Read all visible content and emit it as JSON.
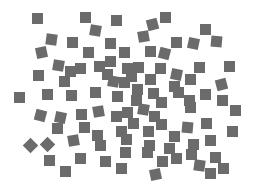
{
  "canvas": {
    "width": 254,
    "height": 190,
    "background": "#ffffff"
  },
  "shape_style": {
    "color": "#6b6b6b",
    "size": 11
  },
  "squares": [
    {
      "x": 37,
      "y": 18,
      "r": 0
    },
    {
      "x": 85,
      "y": 17,
      "r": 0
    },
    {
      "x": 116,
      "y": 20,
      "r": 0
    },
    {
      "x": 165,
      "y": 17,
      "r": 0
    },
    {
      "x": 152,
      "y": 24,
      "r": -15
    },
    {
      "x": 95,
      "y": 30,
      "r": 10
    },
    {
      "x": 205,
      "y": 29,
      "r": 0
    },
    {
      "x": 51,
      "y": 39,
      "r": 8
    },
    {
      "x": 72,
      "y": 42,
      "r": 0
    },
    {
      "x": 110,
      "y": 43,
      "r": 0
    },
    {
      "x": 143,
      "y": 36,
      "r": -10
    },
    {
      "x": 176,
      "y": 42,
      "r": 0
    },
    {
      "x": 193,
      "y": 43,
      "r": 12
    },
    {
      "x": 216,
      "y": 41,
      "r": 5
    },
    {
      "x": 150,
      "y": 51,
      "r": 0
    },
    {
      "x": 41,
      "y": 52,
      "r": -12
    },
    {
      "x": 88,
      "y": 52,
      "r": 0
    },
    {
      "x": 124,
      "y": 52,
      "r": 0
    },
    {
      "x": 164,
      "y": 53,
      "r": 15
    },
    {
      "x": 110,
      "y": 61,
      "r": 0
    },
    {
      "x": 58,
      "y": 65,
      "r": 10
    },
    {
      "x": 80,
      "y": 68,
      "r": 0
    },
    {
      "x": 99,
      "y": 66,
      "r": 0
    },
    {
      "x": 138,
      "y": 67,
      "r": 0
    },
    {
      "x": 127,
      "y": 68,
      "r": 0
    },
    {
      "x": 70,
      "y": 71,
      "r": 0
    },
    {
      "x": 38,
      "y": 75,
      "r": 0
    },
    {
      "x": 64,
      "y": 81,
      "r": 0
    },
    {
      "x": 107,
      "y": 74,
      "r": 0
    },
    {
      "x": 113,
      "y": 81,
      "r": 10
    },
    {
      "x": 124,
      "y": 82,
      "r": 0
    },
    {
      "x": 131,
      "y": 76,
      "r": 0
    },
    {
      "x": 150,
      "y": 79,
      "r": 0
    },
    {
      "x": 176,
      "y": 74,
      "r": 12
    },
    {
      "x": 199,
      "y": 67,
      "r": 0
    },
    {
      "x": 229,
      "y": 66,
      "r": 0
    },
    {
      "x": 221,
      "y": 84,
      "r": -15
    },
    {
      "x": 160,
      "y": 68,
      "r": 0
    },
    {
      "x": 190,
      "y": 79,
      "r": 0
    },
    {
      "x": 174,
      "y": 86,
      "r": 0
    },
    {
      "x": 137,
      "y": 89,
      "r": 0
    },
    {
      "x": 19,
      "y": 97,
      "r": 0
    },
    {
      "x": 47,
      "y": 94,
      "r": 0
    },
    {
      "x": 71,
      "y": 95,
      "r": 0
    },
    {
      "x": 95,
      "y": 92,
      "r": 0
    },
    {
      "x": 117,
      "y": 96,
      "r": 0
    },
    {
      "x": 136,
      "y": 100,
      "r": 0
    },
    {
      "x": 153,
      "y": 93,
      "r": 0
    },
    {
      "x": 178,
      "y": 92,
      "r": 0
    },
    {
      "x": 205,
      "y": 94,
      "r": 0
    },
    {
      "x": 189,
      "y": 100,
      "r": 0
    },
    {
      "x": 161,
      "y": 102,
      "r": 0
    },
    {
      "x": 40,
      "y": 115,
      "r": 15
    },
    {
      "x": 60,
      "y": 117,
      "r": 12
    },
    {
      "x": 81,
      "y": 114,
      "r": 0
    },
    {
      "x": 98,
      "y": 111,
      "r": -10
    },
    {
      "x": 116,
      "y": 116,
      "r": 0
    },
    {
      "x": 143,
      "y": 109,
      "r": 10
    },
    {
      "x": 154,
      "y": 116,
      "r": 0
    },
    {
      "x": 190,
      "y": 107,
      "r": 0
    },
    {
      "x": 222,
      "y": 100,
      "r": 0
    },
    {
      "x": 235,
      "y": 110,
      "r": 0
    },
    {
      "x": 127,
      "y": 112,
      "r": 0
    },
    {
      "x": 57,
      "y": 128,
      "r": 0
    },
    {
      "x": 84,
      "y": 127,
      "r": 0
    },
    {
      "x": 97,
      "y": 135,
      "r": 0
    },
    {
      "x": 121,
      "y": 131,
      "r": 0
    },
    {
      "x": 133,
      "y": 123,
      "r": 0
    },
    {
      "x": 161,
      "y": 124,
      "r": 0
    },
    {
      "x": 187,
      "y": 127,
      "r": 5
    },
    {
      "x": 206,
      "y": 123,
      "r": 0
    },
    {
      "x": 174,
      "y": 136,
      "r": 0
    },
    {
      "x": 210,
      "y": 140,
      "r": 0
    },
    {
      "x": 232,
      "y": 131,
      "r": 0
    },
    {
      "x": 148,
      "y": 131,
      "r": 0
    },
    {
      "x": 30,
      "y": 145,
      "r": 45
    },
    {
      "x": 47,
      "y": 144,
      "r": 45
    },
    {
      "x": 73,
      "y": 140,
      "r": -10
    },
    {
      "x": 100,
      "y": 145,
      "r": 0
    },
    {
      "x": 126,
      "y": 139,
      "r": 0
    },
    {
      "x": 149,
      "y": 145,
      "r": 0
    },
    {
      "x": 169,
      "y": 148,
      "r": 0
    },
    {
      "x": 191,
      "y": 154,
      "r": 0
    },
    {
      "x": 147,
      "y": 152,
      "r": 0
    },
    {
      "x": 125,
      "y": 152,
      "r": 0
    },
    {
      "x": 176,
      "y": 158,
      "r": 0
    },
    {
      "x": 215,
      "y": 157,
      "r": 0
    },
    {
      "x": 49,
      "y": 160,
      "r": 0
    },
    {
      "x": 105,
      "y": 161,
      "r": 0
    },
    {
      "x": 80,
      "y": 158,
      "r": 0
    },
    {
      "x": 162,
      "y": 161,
      "r": 0
    },
    {
      "x": 199,
      "y": 165,
      "r": 8
    },
    {
      "x": 223,
      "y": 168,
      "r": 0
    },
    {
      "x": 193,
      "y": 144,
      "r": 0
    },
    {
      "x": 65,
      "y": 171,
      "r": 0
    },
    {
      "x": 121,
      "y": 168,
      "r": 0
    },
    {
      "x": 155,
      "y": 174,
      "r": -12
    },
    {
      "x": 210,
      "y": 173,
      "r": 0
    }
  ]
}
